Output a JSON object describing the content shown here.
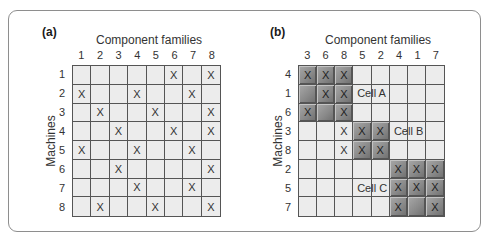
{
  "panel_a": {
    "label": "(a)",
    "xtitle": "Component families",
    "ytitle": "Machines",
    "columns": [
      "1",
      "2",
      "3",
      "4",
      "5",
      "6",
      "7",
      "8"
    ],
    "rows": [
      "1",
      "2",
      "3",
      "4",
      "5",
      "6",
      "7",
      "8"
    ],
    "marks": {
      "1": [
        "6",
        "8"
      ],
      "2": [
        "1",
        "4",
        "7"
      ],
      "3": [
        "2",
        "5",
        "8"
      ],
      "4": [
        "3",
        "6",
        "8"
      ],
      "5": [
        "1",
        "4",
        "7"
      ],
      "6": [
        "3",
        "8"
      ],
      "7": [
        "4",
        "7"
      ],
      "8": [
        "2",
        "5",
        "8"
      ]
    }
  },
  "panel_b": {
    "label": "(b)",
    "xtitle": "Component families",
    "ytitle": "Machines",
    "columns": [
      "3",
      "6",
      "8",
      "5",
      "2",
      "4",
      "1",
      "7"
    ],
    "rows": [
      "4",
      "1",
      "6",
      "3",
      "8",
      "2",
      "5",
      "7"
    ],
    "marks": {
      "4": [
        "3",
        "6",
        "8"
      ],
      "1": [
        "6",
        "8"
      ],
      "6": [
        "3",
        "8"
      ],
      "3": [
        "8",
        "5",
        "2"
      ],
      "8": [
        "8",
        "5",
        "2"
      ],
      "2": [
        "4",
        "1",
        "7"
      ],
      "5": [
        "4",
        "1",
        "7"
      ],
      "7": [
        "4",
        "7"
      ]
    },
    "cells": [
      {
        "name": "Cell A",
        "rows": [
          "4",
          "1",
          "6"
        ],
        "columns": [
          "3",
          "6",
          "8"
        ],
        "label_row": 1,
        "label_col": 3
      },
      {
        "name": "Cell B",
        "rows": [
          "3",
          "8"
        ],
        "columns": [
          "5",
          "2"
        ],
        "label_row": 3,
        "label_col": 5
      },
      {
        "name": "Cell C",
        "rows": [
          "2",
          "5",
          "7"
        ],
        "columns": [
          "4",
          "1",
          "7"
        ],
        "label_row": 6,
        "label_col": 3
      }
    ]
  },
  "mark_symbol": "X",
  "colors": {
    "cell_bg": "#ececec",
    "cell_shaded": "#8a8a8a",
    "grid_line": "#555555",
    "frame": "#8e8e8e"
  }
}
